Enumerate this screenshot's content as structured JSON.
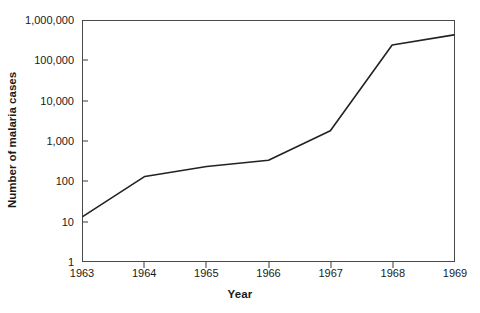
{
  "chart_data": {
    "type": "line",
    "title": "",
    "xlabel": "Year",
    "ylabel": "Number of malaria cases",
    "x": [
      1963,
      1964,
      1965,
      1966,
      1967,
      1968,
      1969
    ],
    "xticklabels": [
      "1963",
      "1964",
      "1965",
      "1966",
      "1967",
      "1968",
      "1969"
    ],
    "yticklabels": [
      "1",
      "10",
      "100",
      "1,000",
      "10,000",
      "100,000",
      "1,000,000"
    ],
    "ytickvalues": [
      1,
      10,
      100,
      1000,
      10000,
      100000,
      1000000
    ],
    "yscale": "log",
    "ylim": [
      1,
      1000000
    ],
    "xlim": [
      1963,
      1969
    ],
    "grid": false,
    "legend": null,
    "line_color": "#222222",
    "series": [
      {
        "name": "Number of malaria cases",
        "values": [
          13,
          130,
          230,
          330,
          1800,
          250000,
          450000
        ]
      }
    ]
  },
  "axes": {
    "y_title": "Number of malaria cases",
    "x_title": "Year"
  }
}
